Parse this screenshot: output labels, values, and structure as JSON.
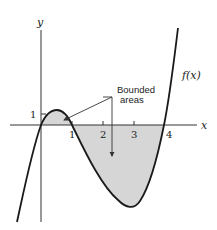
{
  "figure": {
    "axes": {
      "x_label": "x",
      "y_label": "y",
      "x_ticks": [
        "1",
        "2",
        "3",
        "4"
      ],
      "y_ticks": [
        "1"
      ]
    },
    "curve_label": "f(x)",
    "annotation": {
      "line1": "Bounded",
      "line2": "areas"
    },
    "colors": {
      "curve": "#1a1a1a",
      "axis": "#333333",
      "shade": "#d6d6d6",
      "text": "#222222"
    }
  }
}
